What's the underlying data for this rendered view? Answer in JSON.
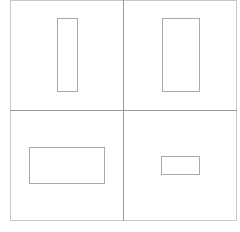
{
  "diagram": {
    "layout": "2x2 grid",
    "colors": {
      "frame": "#c8c8c8",
      "divider": "#9a9a9a",
      "shape_stroke": "#a9a9a9",
      "background": "#ffffff"
    },
    "frame": {
      "x": 10,
      "y": 0,
      "w": 227,
      "h": 221
    },
    "divider_x": 123,
    "divider_y": 110,
    "cells": [
      {
        "position": "top-left",
        "shape": "rectangle",
        "orientation": "tall-narrow",
        "x": 57,
        "y": 18,
        "w": 21,
        "h": 74
      },
      {
        "position": "top-right",
        "shape": "rectangle",
        "orientation": "tall",
        "x": 162,
        "y": 18,
        "w": 38,
        "h": 74
      },
      {
        "position": "bottom-left",
        "shape": "rectangle",
        "orientation": "wide",
        "x": 29,
        "y": 147,
        "w": 76,
        "h": 37
      },
      {
        "position": "bottom-right",
        "shape": "rectangle",
        "orientation": "small-wide",
        "x": 161,
        "y": 156,
        "w": 39,
        "h": 19
      }
    ]
  }
}
